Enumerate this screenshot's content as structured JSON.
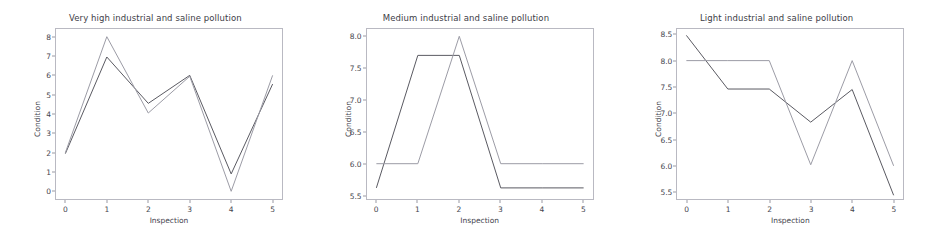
{
  "figure": {
    "background": "#ffffff",
    "panel_count": 3,
    "series_colors": {
      "dark": "#5a5a62",
      "light": "#9c9ca6"
    }
  },
  "chart_data": [
    {
      "type": "line",
      "title": "Very high industrial and saline pollution",
      "xlabel": "Inspection",
      "ylabel": "Condition",
      "x": [
        0,
        1,
        2,
        3,
        4,
        5
      ],
      "xticklabels": [
        "0",
        "1",
        "2",
        "3",
        "4",
        "5"
      ],
      "yticklabels": [
        "0",
        "1",
        "2",
        "3",
        "4",
        "5",
        "6",
        "7",
        "8"
      ],
      "yticks": [
        0,
        1,
        2,
        3,
        4,
        5,
        6,
        7,
        8
      ],
      "xlim": [
        -0.25,
        5.25
      ],
      "ylim": [
        -0.45,
        8.45
      ],
      "grid": false,
      "legend": "none",
      "series": [
        {
          "name": "dark",
          "color": "#5a5a62",
          "values": [
            1.95,
            6.95,
            4.55,
            6.0,
            0.9,
            5.55
          ]
        },
        {
          "name": "light",
          "color": "#9c9ca6",
          "values": [
            2.0,
            8.0,
            4.05,
            5.95,
            0.0,
            6.0
          ]
        }
      ]
    },
    {
      "type": "line",
      "title": "Medium industrial and saline pollution",
      "xlabel": "Inspection",
      "ylabel": "Condition",
      "x": [
        0,
        1,
        2,
        3,
        4,
        5
      ],
      "xticklabels": [
        "0",
        "1",
        "2",
        "3",
        "4",
        "5"
      ],
      "yticklabels": [
        "5.5",
        "6.0",
        "6.5",
        "7.0",
        "7.5",
        "8.0"
      ],
      "yticks": [
        5.5,
        6.0,
        6.5,
        7.0,
        7.5,
        8.0
      ],
      "xlim": [
        -0.25,
        5.25
      ],
      "ylim": [
        5.43,
        8.13
      ],
      "grid": false,
      "legend": "none",
      "series": [
        {
          "name": "dark",
          "color": "#5a5a62",
          "values": [
            5.62,
            7.7,
            7.7,
            5.62,
            5.62,
            5.62
          ]
        },
        {
          "name": "light",
          "color": "#9c9ca6",
          "values": [
            6.0,
            6.0,
            8.0,
            6.0,
            6.0,
            6.0
          ]
        }
      ]
    },
    {
      "type": "line",
      "title": "Light industrial and saline pollution",
      "xlabel": "Inspection",
      "ylabel": "Condition",
      "x": [
        0,
        1,
        2,
        3,
        4,
        5
      ],
      "xticklabels": [
        "0",
        "1",
        "2",
        "3",
        "4",
        "5"
      ],
      "yticklabels": [
        "5.5",
        "6.0",
        "6.5",
        "7.0",
        "7.5",
        "8.0",
        "8.5"
      ],
      "yticks": [
        5.5,
        6.0,
        6.5,
        7.0,
        7.5,
        8.0,
        8.5
      ],
      "xlim": [
        -0.25,
        5.25
      ],
      "ylim": [
        5.35,
        8.62
      ],
      "grid": false,
      "legend": "none",
      "series": [
        {
          "name": "dark",
          "color": "#5a5a62",
          "values": [
            8.48,
            7.46,
            7.46,
            6.83,
            7.45,
            5.44
          ]
        },
        {
          "name": "light",
          "color": "#9c9ca6",
          "values": [
            8.0,
            8.0,
            8.0,
            6.02,
            8.0,
            6.0
          ]
        }
      ]
    }
  ]
}
